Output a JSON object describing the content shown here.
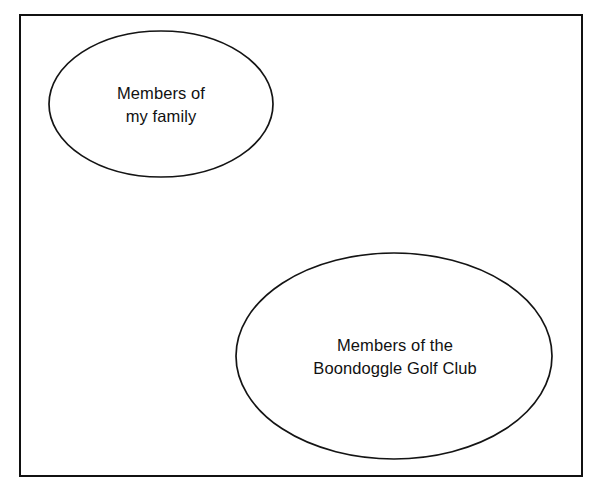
{
  "diagram": {
    "type": "venn-diagram",
    "title": "",
    "universe": {
      "name": "universal-set-rectangle",
      "label": "",
      "border_color": "#111111"
    },
    "sets": [
      {
        "id": "family",
        "name": "members-of-my-family",
        "label_lines": [
          "Members of",
          "my family"
        ],
        "line1": "Members of",
        "line2": "my family",
        "center_x": 161,
        "center_y": 104,
        "radius_x": 112,
        "radius_y": 73,
        "stroke_color": "#141414",
        "fill_color": "none"
      },
      {
        "id": "golf",
        "name": "members-of-the-boondoggle-golf-club",
        "label_lines": [
          "Members of the",
          "Boondoggle Golf Club"
        ],
        "line1": "Members of the",
        "line2": "Boondoggle Golf Club",
        "center_x": 394,
        "center_y": 356,
        "radius_x": 158,
        "radius_y": 103,
        "stroke_color": "#141414",
        "fill_color": "none"
      }
    ],
    "relationship": "disjoint",
    "background_color": "#ffffff"
  }
}
